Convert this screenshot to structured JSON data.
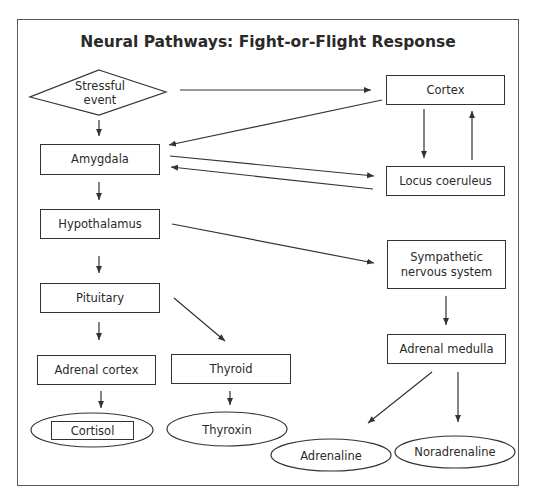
{
  "title": "Neural Pathways: Fight-or-Flight Response",
  "colors": {
    "line": "#333333",
    "text": "#2a2a2a",
    "frame": "#5a5a5a",
    "background": "#ffffff"
  },
  "nodes": {
    "stressful_event": {
      "shape": "diamond",
      "line1": "Stressful",
      "line2": "event"
    },
    "cortex": {
      "shape": "rectangle",
      "label": "Cortex"
    },
    "amygdala": {
      "shape": "rectangle",
      "label": "Amygdala"
    },
    "locus_coeruleus": {
      "shape": "rectangle",
      "label": "Locus coeruleus"
    },
    "hypothalamus": {
      "shape": "rectangle",
      "label": "Hypothalamus"
    },
    "sympathetic": {
      "shape": "rectangle",
      "line1": "Sympathetic",
      "line2": "nervous system"
    },
    "pituitary": {
      "shape": "rectangle",
      "label": "Pituitary"
    },
    "adrenal_medulla": {
      "shape": "rectangle",
      "label": "Adrenal medulla"
    },
    "adrenal_cortex": {
      "shape": "rectangle",
      "label": "Adrenal cortex"
    },
    "thyroid": {
      "shape": "rectangle",
      "label": "Thyroid"
    },
    "cortisol": {
      "shape": "ellipse-with-rect",
      "label": "Cortisol"
    },
    "thyroxin": {
      "shape": "ellipse",
      "label": "Thyroxin"
    },
    "adrenaline": {
      "shape": "ellipse",
      "label": "Adrenaline"
    },
    "noradrenaline": {
      "shape": "ellipse",
      "label": "Noradrenaline"
    }
  },
  "edges": [
    {
      "from": "Stressful event",
      "to": "Cortex"
    },
    {
      "from": "Stressful event",
      "to": "Amygdala"
    },
    {
      "from": "Cortex",
      "to": "Amygdala"
    },
    {
      "from": "Cortex",
      "to": "Locus coeruleus"
    },
    {
      "from": "Locus coeruleus",
      "to": "Cortex"
    },
    {
      "from": "Amygdala",
      "to": "Locus coeruleus"
    },
    {
      "from": "Locus coeruleus",
      "to": "Amygdala"
    },
    {
      "from": "Amygdala",
      "to": "Hypothalamus"
    },
    {
      "from": "Hypothalamus",
      "to": "Sympathetic nervous system"
    },
    {
      "from": "Hypothalamus",
      "to": "Pituitary"
    },
    {
      "from": "Pituitary",
      "to": "Adrenal cortex"
    },
    {
      "from": "Pituitary",
      "to": "Thyroid"
    },
    {
      "from": "Sympathetic nervous system",
      "to": "Adrenal medulla"
    },
    {
      "from": "Adrenal cortex",
      "to": "Cortisol"
    },
    {
      "from": "Thyroid",
      "to": "Thyroxin"
    },
    {
      "from": "Adrenal medulla",
      "to": "Adrenaline"
    },
    {
      "from": "Adrenal medulla",
      "to": "Noradrenaline"
    }
  ]
}
